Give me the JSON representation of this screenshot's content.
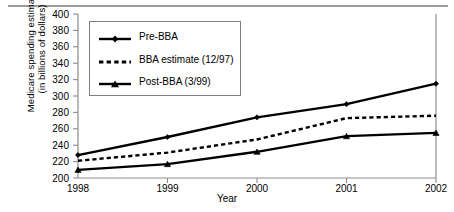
{
  "chart_data": {
    "type": "line",
    "title": "",
    "xlabel": "Year",
    "ylabel": "Medicare spending estimates (in billions of dollars)",
    "ylabel_line1": "Medicare spending estimates",
    "ylabel_line2": "(in billions of dollars)",
    "categories": [
      "1998",
      "1999",
      "2000",
      "2001",
      "2002"
    ],
    "x": [
      1998,
      1999,
      2000,
      2001,
      2002
    ],
    "xlim": [
      1998,
      2002
    ],
    "ylim": [
      200,
      400
    ],
    "ytick_step": 20,
    "yticks": [
      "400",
      "380",
      "360",
      "340",
      "320",
      "300",
      "280",
      "260",
      "240",
      "220",
      "200"
    ],
    "ytick_values": [
      400,
      380,
      360,
      340,
      320,
      300,
      280,
      260,
      240,
      220,
      200
    ],
    "grid": false,
    "legend_position": "upper-left-inside",
    "series": [
      {
        "name": "Pre-BBA",
        "values": [
          228,
          250,
          274,
          290,
          315
        ],
        "style": "solid",
        "marker": "diamond",
        "color": "#000000"
      },
      {
        "name": "BBA estimate (12/97)",
        "values": [
          221,
          231,
          247,
          273,
          276
        ],
        "style": "dashed",
        "marker": "none",
        "color": "#000000"
      },
      {
        "name": "Post-BBA (3/99)",
        "values": [
          210,
          217,
          232,
          251,
          255
        ],
        "style": "solid",
        "marker": "triangle",
        "color": "#000000"
      }
    ]
  },
  "legend": {
    "items": [
      {
        "label": "Pre-BBA"
      },
      {
        "label": "BBA estimate (12/97)"
      },
      {
        "label": "Post-BBA (3/99)"
      }
    ]
  },
  "axes": {
    "x_title": "Year",
    "y_title_line1": "Medicare spending estimates",
    "y_title_line2": "(in billions of dollars)"
  }
}
